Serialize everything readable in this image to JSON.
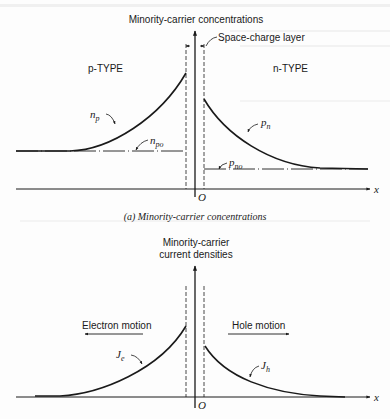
{
  "figure": {
    "panel_a": {
      "y_axis_label": "Minority-carrier concentrations",
      "space_charge_label": "Space-charge layer",
      "left_region_label": "p-TYPE",
      "right_region_label": "n-TYPE",
      "curve_left_label": "n",
      "curve_left_sub": "p",
      "curve_right_label": "p",
      "curve_right_sub": "n",
      "eq_left_label": "n",
      "eq_left_sub": "po",
      "eq_right_label": "p",
      "eq_right_sub": "no",
      "origin_label": "O",
      "x_axis_label": "x",
      "caption": "(a) Minority-carrier concentrations"
    },
    "panel_b": {
      "y_axis_label_line1": "Minority-carrier",
      "y_axis_label_line2": "current densities",
      "left_motion_label": "Electron motion",
      "right_motion_label": "Hole motion",
      "curve_left_label": "J",
      "curve_left_sub": "e",
      "curve_right_label": "J",
      "curve_right_sub": "h",
      "origin_label": "O",
      "x_axis_label": "x"
    }
  },
  "colors": {
    "ink": "#1a1a1a",
    "paper": "#fdfdfd",
    "bleed_through": "#d6d6d6"
  }
}
